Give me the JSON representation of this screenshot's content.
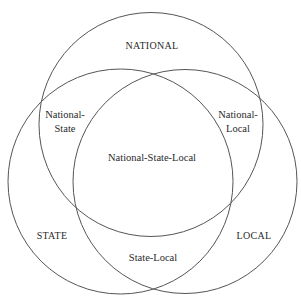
{
  "diagram": {
    "type": "venn",
    "stroke_color": "#555555",
    "text_color": "#2a2a2a",
    "background": "#ffffff",
    "sets": [
      {
        "id": "national",
        "label": "NATIONAL",
        "cx": 151,
        "cy": 124.5,
        "r": 112
      },
      {
        "id": "state",
        "label": "STATE",
        "cx": 120.5,
        "cy": 181.5,
        "r": 112.5
      },
      {
        "id": "local",
        "label": "LOCAL",
        "cx": 185,
        "cy": 181.5,
        "r": 112
      }
    ],
    "regions": {
      "national_only": "NATIONAL",
      "state_only": "STATE",
      "local_only": "LOCAL",
      "national_state": {
        "line1": "National-",
        "line2": "State"
      },
      "national_local": {
        "line1": "National-",
        "line2": "Local"
      },
      "state_local": "State-Local",
      "national_state_local": "National-State-Local"
    }
  }
}
